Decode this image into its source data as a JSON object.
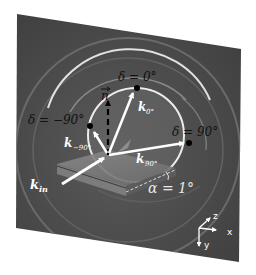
{
  "figure": {
    "colors": {
      "background": "#ffffff",
      "panel": "#4a4a4a",
      "ring": "#d8d8d8",
      "arrow": "#ffffff",
      "dot": "#000000",
      "label_dark": "#111111",
      "label_light": "#ffffff"
    }
  },
  "labels": {
    "delta_0": "δ = 0°",
    "delta_neg90": "δ = −90°",
    "delta_90": "δ = 90°",
    "normal": "n",
    "k_0": "k",
    "k_0_sub": "0°",
    "k_neg90": "k",
    "k_neg90_sub": "−90°",
    "k_90": "k",
    "k_90_sub": "90°",
    "k_in": "k",
    "k_in_sub": "in",
    "alpha": "α = 1°"
  },
  "axes": {
    "x": "x",
    "y": "y",
    "z": "z"
  }
}
